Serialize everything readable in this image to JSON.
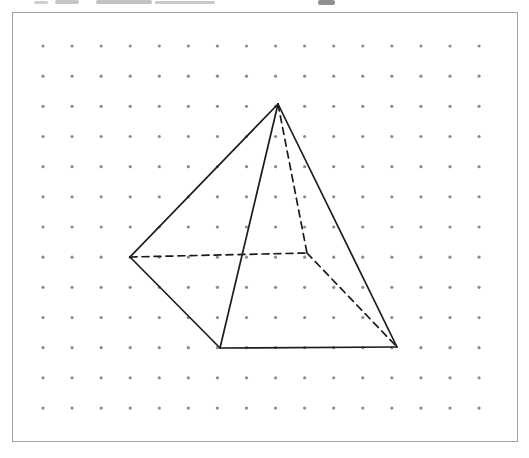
{
  "page": {
    "width": 529,
    "height": 458,
    "background": "#ffffff"
  },
  "frame": {
    "x": 12,
    "y": 12,
    "width": 506,
    "height": 430,
    "border_color": "#a2a2a2"
  },
  "dot_grid": {
    "origin_x": 43,
    "origin_y": 46,
    "cols": 16,
    "rows": 13,
    "dx": 29.07,
    "dy": 30.17,
    "dot_radius": 1.6,
    "dot_color": "#8c8c8c"
  },
  "figure": {
    "type": "square-pyramid-wireframe",
    "stroke_color": "#1c1c1c",
    "stroke_width": 1.7,
    "dash_pattern": "7 5",
    "vertices": {
      "apex": [
        278,
        104
      ],
      "base_left": [
        130,
        257
      ],
      "base_front_left": [
        220,
        348
      ],
      "base_front_right": [
        397,
        347
      ],
      "base_back": [
        307,
        253
      ]
    },
    "edges": [
      {
        "from": "apex",
        "to": "base_left",
        "style": "solid"
      },
      {
        "from": "apex",
        "to": "base_front_left",
        "style": "solid"
      },
      {
        "from": "apex",
        "to": "base_front_right",
        "style": "solid"
      },
      {
        "from": "base_left",
        "to": "base_front_left",
        "style": "solid"
      },
      {
        "from": "base_front_left",
        "to": "base_front_right",
        "style": "solid"
      },
      {
        "from": "apex",
        "to": "base_back",
        "style": "dashed"
      },
      {
        "from": "base_left",
        "to": "base_back",
        "style": "dashed"
      },
      {
        "from": "base_back",
        "to": "base_front_right",
        "style": "dashed"
      }
    ]
  },
  "scan_artifacts": [
    {
      "x": 34,
      "y": 1,
      "w": 14,
      "h": 3,
      "color": "#cfcfcf"
    },
    {
      "x": 55,
      "y": 0,
      "w": 24,
      "h": 4,
      "color": "#c6c6c6"
    },
    {
      "x": 96,
      "y": 0,
      "w": 56,
      "h": 4,
      "color": "#c2c2c2"
    },
    {
      "x": 155,
      "y": 1,
      "w": 60,
      "h": 3,
      "color": "#c9c9c9"
    },
    {
      "x": 318,
      "y": 0,
      "w": 17,
      "h": 5,
      "color": "#8f8f8f"
    }
  ]
}
